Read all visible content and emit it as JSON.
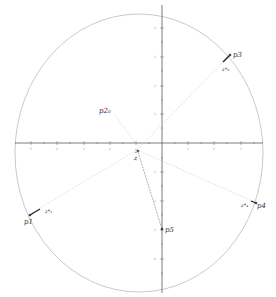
{
  "diagram": {
    "circle": {
      "cx": 139,
      "cy": 153,
      "rx": 124,
      "ry": 139,
      "color": "#bbbbbb"
    },
    "axes": {
      "origin": {
        "x": 162,
        "y": 143
      },
      "x_range": [
        15,
        263
      ],
      "y_range": [
        5,
        293
      ],
      "color": "#444444",
      "x_ticks": [
        31,
        57,
        84,
        110,
        136,
        188,
        214,
        241
      ],
      "x_tick_labels": [
        "-5",
        "-4",
        "-3",
        "-2",
        "-1",
        "1",
        "2",
        "3"
      ],
      "y_ticks": [
        28,
        57,
        86,
        114,
        172,
        201,
        230,
        259
      ],
      "y_tick_labels": [
        "4",
        "3",
        "2",
        "1",
        "-1",
        "-2",
        "-3",
        "-4"
      ]
    },
    "points": [
      {
        "id": "p1",
        "label": "p1",
        "x": 30,
        "y": 215
      },
      {
        "id": "p3",
        "label": "p3",
        "x": 230,
        "y": 55
      },
      {
        "id": "p4",
        "label": "p4",
        "x": 256,
        "y": 203
      },
      {
        "id": "p5",
        "label": "p5",
        "x": 162,
        "y": 229
      },
      {
        "id": "z",
        "label": "z",
        "x": 137,
        "y": 150
      }
    ],
    "labels": {
      "p1": "p1",
      "p3": "p3",
      "p4": "p4",
      "p5": "p5",
      "p2_0": "p2₀",
      "z": "z",
      "z_star_1": "z*₁",
      "z_star_3": "z*₃",
      "z_star_4": "z*₄",
      "z_star_origin": "z*"
    }
  }
}
